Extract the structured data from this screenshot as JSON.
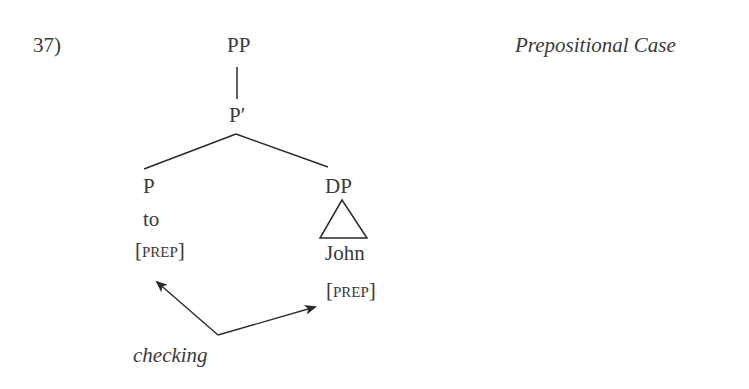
{
  "example": {
    "number": "37)",
    "title": "Prepositional Case"
  },
  "tree": {
    "root": "PP",
    "bar": "P′",
    "head": {
      "label": "P",
      "word": "to",
      "feature_open": "[",
      "feature": "prep",
      "feature_close": "]"
    },
    "complement": {
      "label": "DP",
      "word": "John",
      "feature_open": "[",
      "feature": "prep",
      "feature_close": "]",
      "triangle": true
    }
  },
  "annotation": {
    "label": "checking"
  }
}
